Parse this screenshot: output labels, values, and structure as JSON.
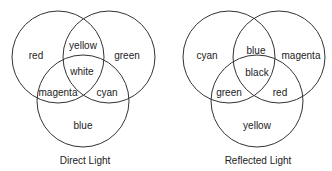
{
  "diagrams": [
    {
      "caption": "Direct Light",
      "regions": {
        "left_only": "red",
        "right_only": "green",
        "bottom_only": "blue",
        "left_right": "yellow",
        "left_bottom": "magenta",
        "right_bottom": "cyan",
        "center": "white"
      }
    },
    {
      "caption": "Reflected Light",
      "regions": {
        "left_only": "cyan",
        "right_only": "magenta",
        "bottom_only": "yellow",
        "left_right": "blue",
        "left_bottom": "green",
        "right_bottom": "red",
        "center": "black"
      }
    }
  ],
  "colors": {
    "stroke": "#333333",
    "text": "#222222",
    "background": "#ffffff"
  }
}
